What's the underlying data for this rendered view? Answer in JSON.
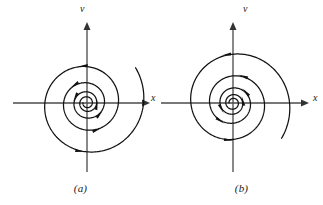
{
  "figure": {
    "type": "phase-portrait-pair",
    "background": "#ffffff",
    "stroke_color": "#111111",
    "axis_color": "#3a3a3a"
  },
  "panels": [
    {
      "id": "a",
      "caption": "(a)",
      "x_axis_label": "x",
      "v_axis_label": "v",
      "description": "unstable spiral, trajectories spiral outward",
      "spiral": {
        "direction": "counterclockwise",
        "flow": "outward",
        "turns": 4.6,
        "center": [
          87,
          103
        ],
        "r_start": 4,
        "r_end": 60,
        "growth": 1.205,
        "arrow_angles_deg": [
          140,
          175,
          210,
          245,
          305,
          340,
          20,
          55
        ]
      },
      "axes": {
        "x_from": [
          13,
          103
        ],
        "x_to": [
          150,
          103
        ],
        "v_from": [
          87,
          172
        ],
        "v_to": [
          87,
          22
        ]
      }
    },
    {
      "id": "b",
      "caption": "(b)",
      "x_axis_label": "x",
      "v_axis_label": "v",
      "description": "stable spiral, trajectories spiral inward",
      "spiral": {
        "direction": "clockwise",
        "flow": "inward",
        "turns": 4.6,
        "center": [
          72,
          103
        ],
        "r_start": 4,
        "r_end": 60,
        "growth": 1.205,
        "arrow_angles_deg": [
          140,
          175,
          210,
          245,
          305,
          340,
          20,
          55
        ]
      },
      "axes": {
        "x_from": [
          -2,
          103
        ],
        "x_to": [
          148,
          103
        ],
        "v_from": [
          72,
          172
        ],
        "v_to": [
          72,
          22
        ]
      }
    }
  ],
  "chart_data": {
    "type": "line",
    "title": "",
    "xlabel": "x",
    "ylabel": "v",
    "series": [
      {
        "name": "unstable-spiral-a",
        "parametric": "r(theta) = r0 * exp(k*theta), theta increasing counterclockwise, r growing outward",
        "r0": 4,
        "r_max": 60,
        "turns": 4.6
      },
      {
        "name": "stable-spiral-b",
        "parametric": "r(theta) = r0 * exp(-k*theta), theta increasing clockwise, r shrinking inward",
        "r0": 60,
        "r_min": 4,
        "turns": 4.6
      }
    ],
    "grid": false,
    "legend": "none",
    "annotations": [
      "(a)",
      "(b)"
    ]
  }
}
